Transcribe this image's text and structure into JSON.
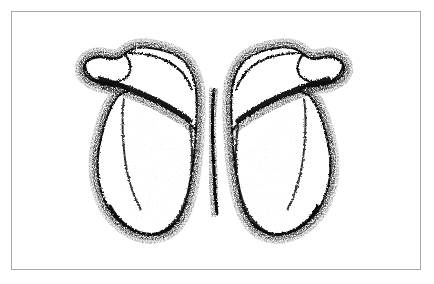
{
  "page": {
    "width": 434,
    "height": 284,
    "background_color": "#ffffff",
    "medium": "pen-and-ink stipple line drawing (scanned halftone)"
  },
  "plate": {
    "frame_color": "#a9a9ad",
    "frame_width_px": 1,
    "frame_rect": {
      "x": 11,
      "y": 11,
      "width": 410,
      "height": 259
    },
    "interior_color": "#ffffff"
  },
  "illustration": {
    "title": "Pair of scapulae, posterior view",
    "subject": "scapula",
    "view": "posterior (dorsal)",
    "count": 2,
    "arrangement": "bilateral mirror pair, medial borders adjoining at center, butterfly-like silhouette",
    "ink_color": "#111111",
    "shading_color": "#2a2a2a",
    "fill_color": "#ffffff",
    "bounding_box": {
      "x": 74,
      "y": 44,
      "width": 280,
      "height": 192
    },
    "specimens": [
      {
        "name": "left-scapula",
        "side": "left",
        "bounding_box": {
          "x": 74,
          "y": 44,
          "width": 142,
          "height": 192
        },
        "features": [
          "acromion process (upper-outer flared tip)",
          "spine of scapula (heavy diagonal ridge)",
          "supraspinous fossa",
          "infraspinous fossa",
          "medial border",
          "lateral border",
          "inferior angle (rounded lower tip)",
          "superior angle"
        ]
      },
      {
        "name": "right-scapula",
        "side": "right",
        "bounding_box": {
          "x": 218,
          "y": 44,
          "width": 136,
          "height": 192
        },
        "features": [
          "acromion process (upper-outer flared tip)",
          "spine of scapula (heavy diagonal ridge)",
          "supraspinous fossa",
          "infraspinous fossa",
          "medial border",
          "lateral border",
          "inferior angle (rounded lower tip)",
          "superior angle"
        ]
      }
    ],
    "stipple": {
      "description": "dense black dot stipple halos the outer contours and the scapular spine; interior fossae are left mostly white with faint sparse speckle",
      "dot_color": "#151515",
      "halo_extent_px": 10
    }
  }
}
